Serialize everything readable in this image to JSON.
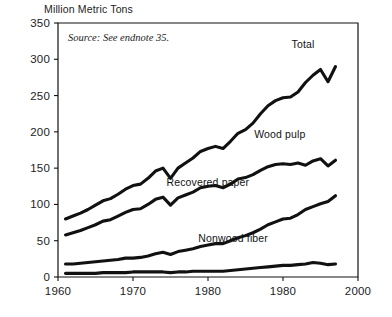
{
  "header": {
    "axis_title": "Million Metric Tons"
  },
  "notes": {
    "source": "Source: See endnote 35."
  },
  "series_labels": {
    "total": "Total",
    "wood_pulp": "Wood pulp",
    "recovered_paper": "Recovered paper",
    "nonwood_fiber": "Nonwood fiber"
  },
  "colors": {
    "line": "#111111",
    "axis": "#111111",
    "text": "#1d1d1d",
    "background": "#ffffff"
  },
  "chart_data": {
    "type": "line",
    "title": "",
    "subtitle": "",
    "xlabel": "",
    "ylabel": "Million Metric Tons",
    "ylim": [
      0,
      350
    ],
    "xlim": [
      1960,
      2000
    ],
    "ytick_labels": [
      "0",
      "50",
      "100",
      "150",
      "200",
      "250",
      "300",
      "350"
    ],
    "ytick_values": [
      0,
      50,
      100,
      150,
      200,
      250,
      300,
      350
    ],
    "xtick_labels": [
      "1960",
      "1970",
      "1980",
      "1980",
      "2000"
    ],
    "xtick_values": [
      1960,
      1970,
      1980,
      1990,
      2000
    ],
    "grid": false,
    "legend": "inline-right-labels",
    "annotations": [
      "Source: See endnote 35."
    ],
    "x": [
      1961,
      1962,
      1963,
      1964,
      1965,
      1966,
      1967,
      1968,
      1969,
      1970,
      1971,
      1972,
      1973,
      1974,
      1975,
      1976,
      1977,
      1978,
      1979,
      1980,
      1981,
      1982,
      1983,
      1984,
      1985,
      1986,
      1987,
      1988,
      1989,
      1990,
      1991,
      1992,
      1993,
      1994,
      1995,
      1996,
      1997
    ],
    "series": [
      {
        "name": "Total",
        "label": "Total",
        "values": [
          80,
          84,
          88,
          93,
          99,
          105,
          108,
          114,
          121,
          126,
          128,
          136,
          146,
          150,
          136,
          150,
          157,
          164,
          173,
          177,
          180,
          177,
          187,
          198,
          203,
          212,
          225,
          236,
          243,
          247,
          248,
          255,
          268,
          278,
          286,
          269,
          290
        ]
      },
      {
        "name": "Wood pulp",
        "label": "Wood pulp",
        "values": [
          58,
          61,
          64,
          68,
          72,
          77,
          79,
          84,
          89,
          93,
          94,
          100,
          107,
          110,
          99,
          109,
          113,
          117,
          123,
          125,
          126,
          123,
          128,
          135,
          137,
          141,
          147,
          152,
          155,
          156,
          155,
          157,
          154,
          160,
          163,
          153,
          161
        ]
      },
      {
        "name": "Recovered paper",
        "label": "Recovered paper",
        "values": [
          18,
          18,
          19,
          20,
          21,
          22,
          23,
          24,
          26,
          26,
          27,
          29,
          32,
          34,
          31,
          35,
          37,
          39,
          42,
          44,
          46,
          46,
          50,
          54,
          57,
          61,
          66,
          72,
          76,
          80,
          81,
          86,
          93,
          97,
          101,
          104,
          112
        ]
      },
      {
        "name": "Nonwood fiber",
        "label": "Nonwood fiber",
        "values": [
          5,
          5,
          5,
          5,
          5,
          6,
          6,
          6,
          6,
          7,
          7,
          7,
          7,
          7,
          6,
          7,
          7,
          8,
          8,
          8,
          8,
          8,
          9,
          10,
          11,
          12,
          13,
          14,
          15,
          16,
          16,
          17,
          18,
          20,
          19,
          17,
          18
        ]
      }
    ],
    "label_positions": [
      {
        "name": "Total",
        "x": 1994.2,
        "y": 315
      },
      {
        "name": "Wood pulp",
        "x": 1993.0,
        "y": 192
      },
      {
        "name": "Recovered paper",
        "x": 1985.5,
        "y": 126
      },
      {
        "name": "Nonwood fiber",
        "x": 1988.0,
        "y": 48
      }
    ]
  }
}
